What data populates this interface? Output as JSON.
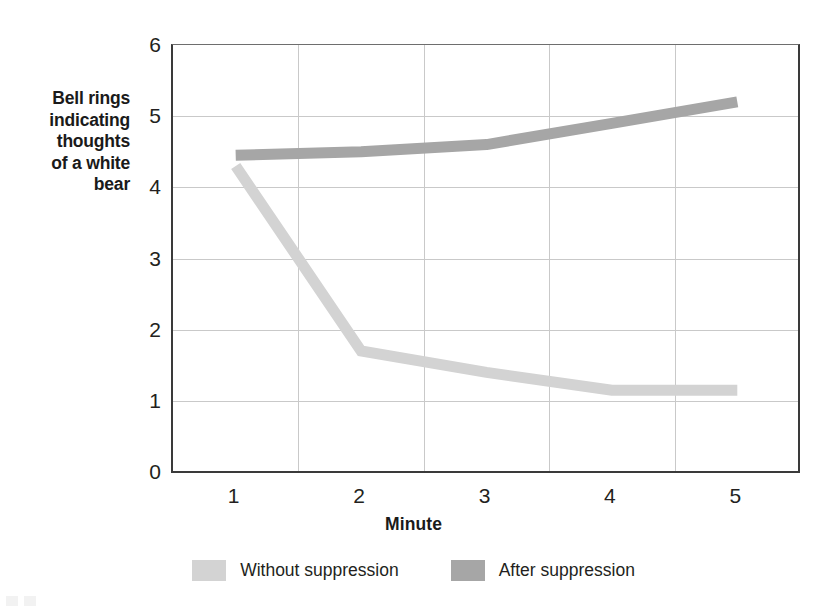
{
  "chart_data": {
    "type": "line",
    "title": "",
    "xlabel": "Minute",
    "ylabel": "Bell rings\nindicating\nthoughts\nof a white\nbear",
    "categories": [
      "1",
      "2",
      "3",
      "4",
      "5"
    ],
    "x": [
      1,
      2,
      3,
      4,
      5
    ],
    "xlim": [
      0.5,
      5.5
    ],
    "ylim": [
      0,
      6
    ],
    "yticks": [
      "0",
      "1",
      "2",
      "3",
      "4",
      "5",
      "6"
    ],
    "ytick_values": [
      0,
      1,
      2,
      3,
      4,
      5,
      6
    ],
    "grid": "horizontal-and-vertical",
    "legend_position": "bottom-center",
    "series": [
      {
        "name": "Without suppression",
        "color": "#d3d3d3",
        "values": [
          4.3,
          1.7,
          1.4,
          1.15,
          1.15
        ]
      },
      {
        "name": "After suppression",
        "color": "#a6a6a6",
        "values": [
          4.45,
          4.5,
          4.6,
          4.9,
          5.2
        ]
      }
    ]
  },
  "axis": {
    "y_title": "Bell rings\nindicating\nthoughts\nof a white\nbear",
    "x_title": "Minute"
  },
  "legend": {
    "items": [
      {
        "label": "Without suppression",
        "color": "#d3d3d3"
      },
      {
        "label": "After suppression",
        "color": "#a6a6a6"
      }
    ]
  },
  "colors": {
    "without_suppression": "#d3d3d3",
    "after_suppression": "#a6a6a6",
    "axis": "#3a3a3a",
    "grid": "#c9c9c9",
    "text": "#231f20",
    "background": "#ffffff"
  }
}
